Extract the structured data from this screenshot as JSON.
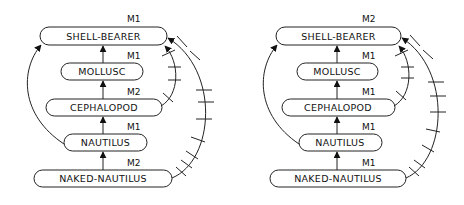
{
  "diagrams": [
    {
      "nodes": [
        {
          "label": "SHELL-BEARER",
          "marker": "M1"
        },
        {
          "label": "MOLLUSC",
          "marker": "M1"
        },
        {
          "label": "CEPHALOPOD",
          "marker": "M2"
        },
        {
          "label": "NAUTILUS",
          "marker": "M1"
        },
        {
          "label": "NAKED-NAUTILUS",
          "marker": "M2"
        }
      ]
    },
    {
      "nodes": [
        {
          "label": "SHELL-BEARER",
          "marker": "M2"
        },
        {
          "label": "MOLLUSC",
          "marker": "M1"
        },
        {
          "label": "CEPHALOPOD",
          "marker": "M1"
        },
        {
          "label": "NAUTILUS",
          "marker": "M1"
        },
        {
          "label": "NAKED-NAUTILUS",
          "marker": "M1"
        }
      ]
    }
  ],
  "colors": {
    "stroke": "#222222",
    "background": "#ffffff"
  }
}
